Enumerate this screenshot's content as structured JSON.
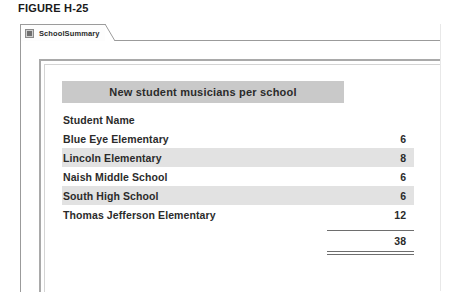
{
  "figure": {
    "caption": "FIGURE H-25"
  },
  "window": {
    "tabs": [
      {
        "label": "SchoolSummary",
        "icon": "table-grid-icon",
        "selected": true
      }
    ]
  },
  "report": {
    "title": "New student musicians per school",
    "columns": [
      "Student  Name",
      ""
    ],
    "rows": [
      {
        "name": "Blue Eye Elementary",
        "value": "6",
        "shaded": false
      },
      {
        "name": "Lincoln Elementary",
        "value": "8",
        "shaded": true
      },
      {
        "name": "Naish Middle School",
        "value": "6",
        "shaded": false
      },
      {
        "name": "South High School",
        "value": "6",
        "shaded": true
      },
      {
        "name": "Thomas Jefferson Elementary",
        "value": "12",
        "shaded": false
      }
    ],
    "total": {
      "label": "",
      "value": "38"
    }
  },
  "colors": {
    "title_band": "#c9c9c9",
    "row_shade": "#e2e2e2",
    "text": "#2b2b2b",
    "frame_border": "#a9a9a9",
    "rule": "#6e6e6e"
  }
}
